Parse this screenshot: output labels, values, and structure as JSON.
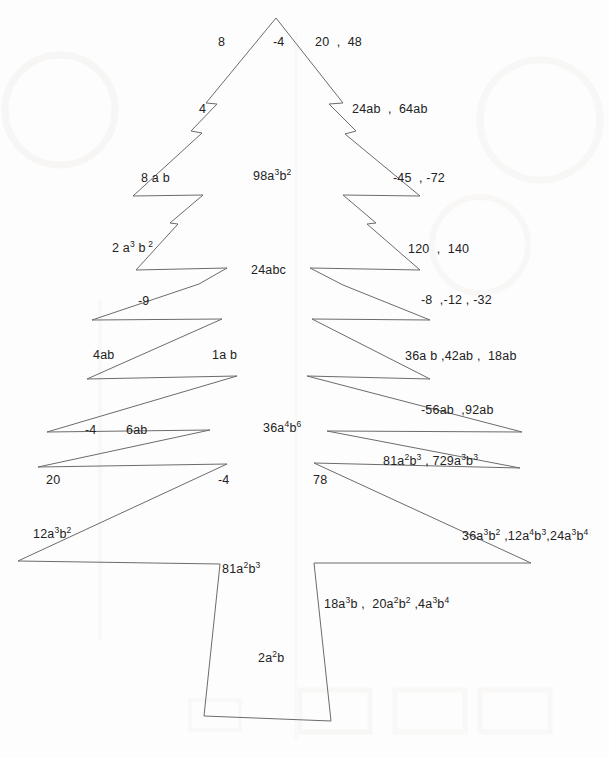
{
  "document": {
    "kind": "christmas-tree-worksheet",
    "page_background": "#fdfdfd",
    "ink_color": "#6b6b6b",
    "text_color": "#222222"
  },
  "labels": [
    {
      "id": "l-8",
      "text": "8",
      "html": "8",
      "x": 218,
      "y": 36,
      "side": "left"
    },
    {
      "id": "l-neg4-top",
      "text": "-4",
      "html": "-4",
      "x": 273,
      "y": 36,
      "side": "left"
    },
    {
      "id": "r-20-48",
      "text": "20  ,  48",
      "html": "20&nbsp;&nbsp;,&nbsp;&nbsp;48",
      "x": 315,
      "y": 36,
      "side": "right"
    },
    {
      "id": "l-4",
      "text": "4",
      "html": "4",
      "x": 199,
      "y": 103,
      "side": "left"
    },
    {
      "id": "r-24ab",
      "text": "24ab  ,  64ab",
      "html": "24ab&nbsp;&nbsp;,&nbsp;&nbsp;64ab",
      "x": 352,
      "y": 103,
      "side": "right"
    },
    {
      "id": "l-8ab",
      "text": "8 a b",
      "html": "8 a b",
      "x": 141,
      "y": 172,
      "side": "left"
    },
    {
      "id": "c-98a3b2",
      "text": "98a3b2",
      "html": "98a<sup>3</sup>b<sup>2</sup>",
      "x": 253,
      "y": 170,
      "side": "center"
    },
    {
      "id": "r-45-72",
      "text": "-45  , -72",
      "html": "-45&nbsp;&nbsp;, -72",
      "x": 393,
      "y": 172,
      "side": "right"
    },
    {
      "id": "l-2a3b2",
      "text": "2 a3 b 2",
      "html": "2 a<sup>3</sup> b<sup>&nbsp;2</sup>",
      "x": 112,
      "y": 242,
      "side": "left"
    },
    {
      "id": "r-120-140",
      "text": "120  ,  140",
      "html": "120&nbsp;&nbsp;,&nbsp;&nbsp;140",
      "x": 408,
      "y": 243,
      "side": "right"
    },
    {
      "id": "c-24abc",
      "text": "24abc",
      "html": "24abc",
      "x": 251,
      "y": 264,
      "side": "center"
    },
    {
      "id": "l-neg9",
      "text": "-9",
      "html": "-9",
      "x": 138,
      "y": 295,
      "side": "left"
    },
    {
      "id": "r-8-12-32",
      "text": "-8  ,-12 , -32",
      "html": "-8&nbsp;&nbsp;,-12 , -32",
      "x": 421,
      "y": 294,
      "side": "right"
    },
    {
      "id": "l-4ab",
      "text": "4ab",
      "html": "4ab",
      "x": 93,
      "y": 349,
      "side": "left"
    },
    {
      "id": "c-1ab",
      "text": "1a b",
      "html": "1a b",
      "x": 212,
      "y": 349,
      "side": "center"
    },
    {
      "id": "r-36a-42-18",
      "text": "36a b ,42ab ,  18ab",
      "html": "36a b ,42ab&nbsp;,&nbsp;&nbsp;18ab",
      "x": 405,
      "y": 350,
      "side": "right"
    },
    {
      "id": "r-56-92",
      "text": "-56ab  ,92ab",
      "html": "-56ab&nbsp;&nbsp;,92ab",
      "x": 421,
      "y": 404,
      "side": "right"
    },
    {
      "id": "l-neg4-mid",
      "text": "-4",
      "html": "-4",
      "x": 85,
      "y": 424,
      "side": "left"
    },
    {
      "id": "l-6ab",
      "text": "6ab",
      "html": "6ab",
      "x": 126,
      "y": 424,
      "side": "left"
    },
    {
      "id": "c-36a4b6",
      "text": "36a4b6",
      "html": "36a<sup>4</sup>b<sup>6</sup>",
      "x": 263,
      "y": 422,
      "side": "center"
    },
    {
      "id": "r-81-729",
      "text": "81a2b3 , 729a3b3",
      "html": "81a<sup>2</sup>b<sup>3</sup> , 729a<sup>3</sup>b<sup>3</sup>",
      "x": 383,
      "y": 455,
      "side": "right"
    },
    {
      "id": "l-20",
      "text": "20",
      "html": "20",
      "x": 46,
      "y": 474,
      "side": "left"
    },
    {
      "id": "l-neg4-low",
      "text": "-4",
      "html": "-4",
      "x": 218,
      "y": 474,
      "side": "left"
    },
    {
      "id": "r-78",
      "text": "78",
      "html": "78",
      "x": 313,
      "y": 474,
      "side": "right"
    },
    {
      "id": "l-12a3b2",
      "text": "12a3b2",
      "html": "12a<sup>3</sup>b<sup>2</sup>",
      "x": 33,
      "y": 528,
      "side": "left"
    },
    {
      "id": "r-36-12-24",
      "text": "36a3b2 ,12a4b3,24a3b4",
      "html": "36a<sup>3</sup>b<sup>2</sup> ,12a<sup>4</sup>b<sup>3</sup>,24a<sup>3</sup>b<sup>4</sup>",
      "x": 462,
      "y": 530,
      "side": "right"
    },
    {
      "id": "c-81a2b3",
      "text": "81a2b3",
      "html": "81a<sup>2</sup>b<sup>3</sup>",
      "x": 222,
      "y": 563,
      "side": "center"
    },
    {
      "id": "r-18-20-4",
      "text": "18a3b ,  20a2b2 ,4a3b4",
      "html": "18a<sup>3</sup>b&nbsp;,&nbsp;&nbsp;20a<sup>2</sup>b<sup>2</sup>&nbsp;,4a<sup>3</sup>b<sup>4</sup>",
      "x": 324,
      "y": 598,
      "side": "right"
    },
    {
      "id": "c-2a2b",
      "text": "2a2b",
      "html": "2a<sup>2</sup>b",
      "x": 258,
      "y": 652,
      "side": "center"
    }
  ],
  "tree": {
    "apex": {
      "x": 276,
      "y": 18
    },
    "left_path": "276,18 206,103 217,104 191,131 202,133 133,196 203,195 170,223 178,224 136,270 227,268 199,284 92,320 222,319 87,379 237,376 47,432 210,430 38,467 227,464 18,561 220,564",
    "right_path": "276,18 343,103 329,104 356,131 345,134 420,196 343,195 376,223 367,224 420,270 310,268 343,285 430,320 312,319 430,379 307,376 522,432 327,431 520,468 314,463 531,563 314,563",
    "trunk_path": "220,564 204,716 331,721 314,563",
    "stroke_width": 1
  }
}
